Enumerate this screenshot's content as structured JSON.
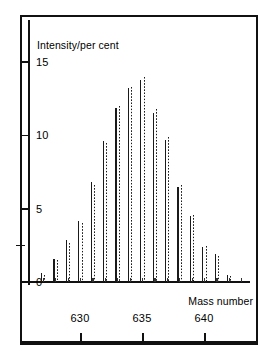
{
  "figure": {
    "title": "",
    "y_axis_title": "Intensity/per cent",
    "x_axis_title": "Mass number"
  },
  "axes": {
    "y_ticks": [
      "0",
      "5",
      "10",
      "15"
    ],
    "x_ticks": [
      "630",
      "635",
      "640"
    ]
  },
  "chart_data": {
    "type": "bar",
    "title": "",
    "subtitle": "",
    "xlabel": "Mass number",
    "ylabel": "Intensity/per cent",
    "xlim": [
      626.5,
      643.5
    ],
    "ylim": [
      0,
      16
    ],
    "ytick_values": [
      0,
      5,
      10,
      15
    ],
    "xtick_values": [
      630,
      635,
      640
    ],
    "grid": false,
    "legend_position": "none",
    "categories": [
      627,
      628,
      629,
      630,
      631,
      632,
      633,
      634,
      635,
      636,
      637,
      638,
      639,
      640,
      641,
      642,
      643
    ],
    "series": [
      {
        "name": "observed",
        "style": "solid",
        "values": [
          0.6,
          1.6,
          2.9,
          4.2,
          6.8,
          9.6,
          11.9,
          13.2,
          13.8,
          11.5,
          9.7,
          6.5,
          4.5,
          2.4,
          1.9,
          0.5,
          0.0
        ]
      },
      {
        "name": "calculated",
        "style": "dotted",
        "values": [
          0.5,
          1.5,
          2.7,
          4.0,
          6.6,
          9.5,
          12.0,
          13.3,
          14.0,
          11.8,
          9.9,
          6.6,
          4.6,
          2.5,
          1.8,
          0.4,
          0.0
        ]
      }
    ]
  }
}
